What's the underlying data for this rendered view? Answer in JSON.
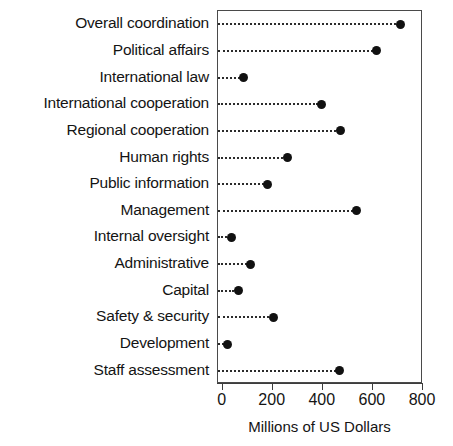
{
  "chart_data": {
    "type": "scatter",
    "subtype": "dot-plot",
    "title": "",
    "xlabel": "Millions of US Dollars",
    "ylabel": "",
    "xlim": [
      0,
      800
    ],
    "xticks": [
      0,
      200,
      400,
      600,
      800
    ],
    "xtick_labels": [
      "0",
      "200",
      "400",
      "600",
      "800"
    ],
    "grid": false,
    "legend": false,
    "leader_lines": true,
    "marker": "filled-circle",
    "marker_color": "#111111",
    "categories": [
      "Overall coordination",
      "Political affairs",
      "International law",
      "International cooperation",
      "Regional cooperation",
      "Human rights",
      "Public information",
      "Management",
      "Internal oversight",
      "Administrative",
      "Capital",
      "Safety & security",
      "Development",
      "Staff assessment"
    ],
    "values": [
      710,
      615,
      85,
      395,
      470,
      258,
      180,
      535,
      35,
      112,
      62,
      203,
      20,
      467
    ]
  },
  "axis": {
    "x_title": "Millions of US Dollars"
  }
}
